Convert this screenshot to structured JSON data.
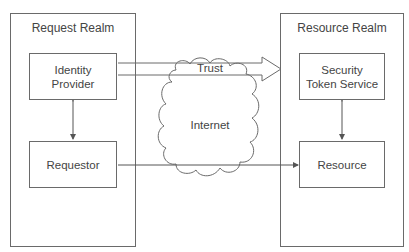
{
  "diagram": {
    "realms": [
      {
        "id": "request",
        "title": "Request Realm"
      },
      {
        "id": "resource",
        "title": "Resource Realm"
      }
    ],
    "nodes": [
      {
        "id": "idp",
        "label_line1": "Identity",
        "label_line2": "Provider"
      },
      {
        "id": "requestor",
        "label": "Requestor"
      },
      {
        "id": "sts",
        "label_line1": "Security",
        "label_line2": "Token Service"
      },
      {
        "id": "resource",
        "label": "Resource"
      }
    ],
    "cloud": {
      "label": "Internet"
    },
    "edges": [
      {
        "from": "idp",
        "to": "sts",
        "label": "Trust",
        "style": "block-arrow"
      },
      {
        "from": "idp",
        "to": "requestor",
        "style": "double-arrow"
      },
      {
        "from": "sts",
        "to": "resource",
        "style": "double-arrow"
      },
      {
        "from": "requestor",
        "to": "resource",
        "style": "arrow"
      }
    ],
    "colors": {
      "stroke": "#6a6a6a",
      "text": "#444444",
      "background": "#ffffff"
    }
  }
}
